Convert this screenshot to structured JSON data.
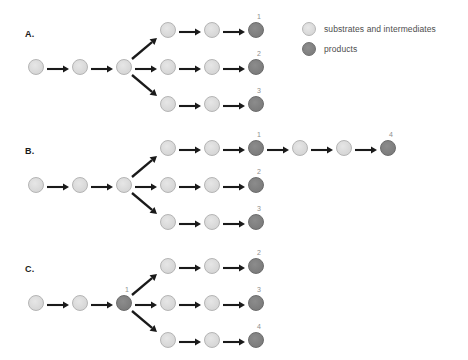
{
  "figure": {
    "background_color": "#ffffff",
    "node_colors": {
      "substrate": "#dcdcdc",
      "product": "#828282",
      "arrow": "#1a1a1a",
      "number": "#8e8e8e"
    }
  },
  "legend": {
    "items": [
      {
        "swatch": "light",
        "label": "substrates and intermediates",
        "icon": "light-circle-icon"
      },
      {
        "swatch": "dark",
        "label": "products",
        "icon": "dark-circle-icon"
      }
    ]
  },
  "panels": [
    {
      "id": "A",
      "label": "A.",
      "trunk": {
        "nodes": [
          "substrate",
          "substrate",
          "substrate"
        ],
        "labels": [
          "",
          "",
          ""
        ]
      },
      "branches": [
        {
          "direction": "up",
          "nodes": [
            "substrate",
            "substrate",
            "product"
          ],
          "labels": [
            "",
            "",
            "1"
          ]
        },
        {
          "direction": "middle",
          "nodes": [
            "substrate",
            "substrate",
            "product"
          ],
          "labels": [
            "",
            "",
            "2"
          ]
        },
        {
          "direction": "down",
          "nodes": [
            "substrate",
            "substrate",
            "product"
          ],
          "labels": [
            "",
            "",
            "3"
          ]
        }
      ],
      "extension": {
        "present": false,
        "nodes": [],
        "labels": []
      }
    },
    {
      "id": "B",
      "label": "B.",
      "trunk": {
        "nodes": [
          "substrate",
          "substrate",
          "substrate"
        ],
        "labels": [
          "",
          "",
          ""
        ]
      },
      "branches": [
        {
          "direction": "up",
          "nodes": [
            "substrate",
            "substrate",
            "product"
          ],
          "labels": [
            "",
            "",
            "1"
          ]
        },
        {
          "direction": "middle",
          "nodes": [
            "substrate",
            "substrate",
            "product"
          ],
          "labels": [
            "",
            "",
            "2"
          ]
        },
        {
          "direction": "down",
          "nodes": [
            "substrate",
            "substrate",
            "product"
          ],
          "labels": [
            "",
            "",
            "3"
          ]
        }
      ],
      "extension": {
        "present": true,
        "on_branch": "up",
        "nodes": [
          "substrate",
          "substrate",
          "product"
        ],
        "labels": [
          "",
          "",
          "4"
        ]
      }
    },
    {
      "id": "C",
      "label": "C.",
      "trunk": {
        "nodes": [
          "substrate",
          "substrate",
          "product"
        ],
        "labels": [
          "",
          "",
          "1"
        ]
      },
      "branches": [
        {
          "direction": "up",
          "nodes": [
            "substrate",
            "substrate",
            "product"
          ],
          "labels": [
            "",
            "",
            "2"
          ]
        },
        {
          "direction": "middle",
          "nodes": [
            "substrate",
            "substrate",
            "product"
          ],
          "labels": [
            "",
            "",
            "3"
          ]
        },
        {
          "direction": "down",
          "nodes": [
            "substrate",
            "substrate",
            "product"
          ],
          "labels": [
            "",
            "",
            "4"
          ]
        }
      ],
      "extension": {
        "present": false,
        "nodes": [],
        "labels": []
      }
    }
  ]
}
